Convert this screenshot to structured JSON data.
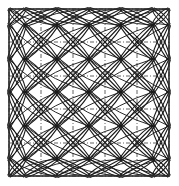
{
  "figure": {
    "title": "Geometric lattice line diagram",
    "type": "line-diagram",
    "width": 179,
    "height": 186,
    "background_color": "#ffffff",
    "stroke_color": "#1a1a1a",
    "frame": {
      "name": "outer square border",
      "x": 9,
      "y": 9,
      "width": 160,
      "height": 167,
      "stroke_width": 1.6,
      "color": "#2a2a2a"
    },
    "grid": {
      "name": "dash-dot construction grid",
      "style": "dash-dot",
      "dash_pattern": "4 2 1 2",
      "stroke_width": 0.8,
      "color": "#3a3a3a",
      "columns": 5,
      "rows": 5,
      "x_positions": [
        9,
        41,
        73,
        105,
        137,
        169
      ],
      "y_positions": [
        9,
        42,
        76,
        109,
        143,
        176
      ]
    },
    "nodes": {
      "name": "bundle crossing nodes",
      "count": 16,
      "x_positions": [
        25,
        57,
        89,
        121,
        153
      ],
      "y_positions": [
        25,
        59,
        92,
        126,
        159
      ],
      "marker": "X-crossing"
    },
    "bundles": {
      "name": "curved diagonal line bundles",
      "lines_per_bundle": 3,
      "bundle_offsets": [
        -1.6,
        0,
        1.6
      ],
      "stroke_width": 1.1,
      "curvature": 7,
      "direction_a": "down-right diagonal",
      "direction_b": "down-left diagonal",
      "shape_formed": "lens / leaf"
    },
    "legend_entries": []
  }
}
